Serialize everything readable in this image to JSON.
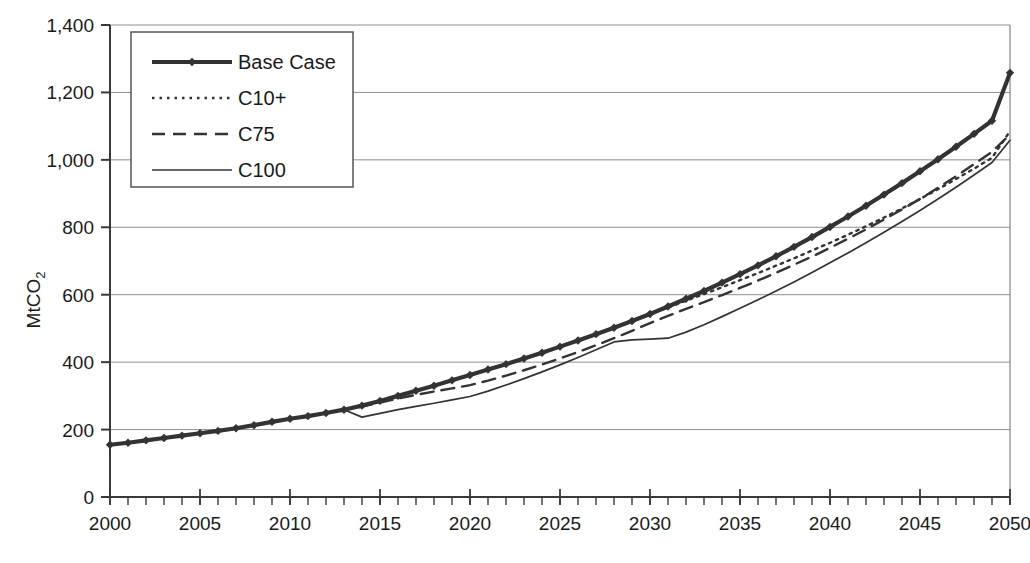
{
  "chart_data": {
    "type": "line",
    "title": "",
    "xlabel": "",
    "ylabel": "MtCO2",
    "ylabel_base": "MtCO",
    "ylabel_sub": "2",
    "xlim": [
      2000,
      2050
    ],
    "ylim": [
      0,
      1400
    ],
    "grid": true,
    "grid_axis": "y",
    "legend_position": "top-left inside plot",
    "x_tick_labels": [
      "2000",
      "2005",
      "2010",
      "2015",
      "2020",
      "2025",
      "2030",
      "2035",
      "2040",
      "2045",
      "2050"
    ],
    "x_tick_values": [
      2000,
      2005,
      2010,
      2015,
      2020,
      2025,
      2030,
      2035,
      2040,
      2045,
      2050
    ],
    "x_minor_tick_interval": 1,
    "y_tick_labels": [
      "0",
      "200",
      "400",
      "600",
      "800",
      "1,000",
      "1,200",
      "1,400"
    ],
    "y_tick_values": [
      0,
      200,
      400,
      600,
      800,
      1000,
      1200,
      1400
    ],
    "x": [
      2000,
      2001,
      2002,
      2003,
      2004,
      2005,
      2006,
      2007,
      2008,
      2009,
      2010,
      2011,
      2012,
      2013,
      2014,
      2015,
      2016,
      2017,
      2018,
      2019,
      2020,
      2021,
      2022,
      2023,
      2024,
      2025,
      2026,
      2027,
      2028,
      2029,
      2030,
      2031,
      2032,
      2033,
      2034,
      2035,
      2036,
      2037,
      2038,
      2039,
      2040,
      2041,
      2042,
      2043,
      2044,
      2045,
      2046,
      2047,
      2048,
      2049,
      2050
    ],
    "series": [
      {
        "name": "Base Case",
        "style": "thick-solid-with-diamond-markers",
        "color": "#333333",
        "values": [
          155,
          161,
          168,
          175,
          182,
          189,
          196,
          204,
          213,
          223,
          232,
          240,
          249,
          259,
          271,
          285,
          300,
          315,
          330,
          346,
          362,
          378,
          394,
          411,
          428,
          446,
          464,
          483,
          502,
          522,
          543,
          565,
          588,
          611,
          636,
          661,
          687,
          714,
          742,
          771,
          801,
          832,
          864,
          897,
          931,
          966,
          1002,
          1039,
          1077,
          1116,
          1258
        ]
      },
      {
        "name": "C10+",
        "style": "dotted",
        "color": "#333333",
        "values": [
          155,
          161,
          168,
          175,
          182,
          189,
          196,
          204,
          213,
          223,
          232,
          240,
          249,
          259,
          271,
          285,
          300,
          315,
          330,
          346,
          362,
          378,
          394,
          411,
          428,
          446,
          464,
          483,
          502,
          522,
          543,
          562,
          582,
          602,
          622,
          643,
          664,
          686,
          708,
          731,
          754,
          778,
          803,
          829,
          856,
          884,
          913,
          943,
          974,
          1006,
          1085
        ]
      },
      {
        "name": "C75",
        "style": "dashed",
        "color": "#333333",
        "values": [
          155,
          161,
          168,
          175,
          182,
          189,
          196,
          204,
          213,
          223,
          232,
          240,
          249,
          259,
          268,
          280,
          292,
          303,
          313,
          322,
          332,
          345,
          360,
          376,
          393,
          411,
          430,
          450,
          471,
          493,
          516,
          537,
          558,
          578,
          599,
          620,
          642,
          665,
          689,
          713,
          739,
          766,
          794,
          823,
          853,
          884,
          917,
          951,
          987,
          1024,
          1075
        ]
      },
      {
        "name": "C100",
        "style": "thin-solid",
        "color": "#333333",
        "values": [
          155,
          161,
          168,
          175,
          182,
          189,
          196,
          204,
          213,
          223,
          232,
          240,
          249,
          259,
          237,
          248,
          259,
          269,
          278,
          288,
          298,
          314,
          332,
          351,
          371,
          392,
          414,
          437,
          460,
          466,
          468,
          471,
          489,
          511,
          535,
          560,
          585,
          611,
          638,
          666,
          695,
          724,
          754,
          785,
          817,
          850,
          884,
          919,
          955,
          992,
          1058
        ]
      }
    ]
  },
  "legend": {
    "items": [
      {
        "label": "Base Case",
        "style": "thick-solid-with-diamond-markers"
      },
      {
        "label": "C10+",
        "style": "dotted"
      },
      {
        "label": "C75",
        "style": "dashed"
      },
      {
        "label": "C100",
        "style": "thin-solid"
      }
    ]
  },
  "axis": {
    "y_title_base": "MtCO",
    "y_title_sub": "2"
  }
}
